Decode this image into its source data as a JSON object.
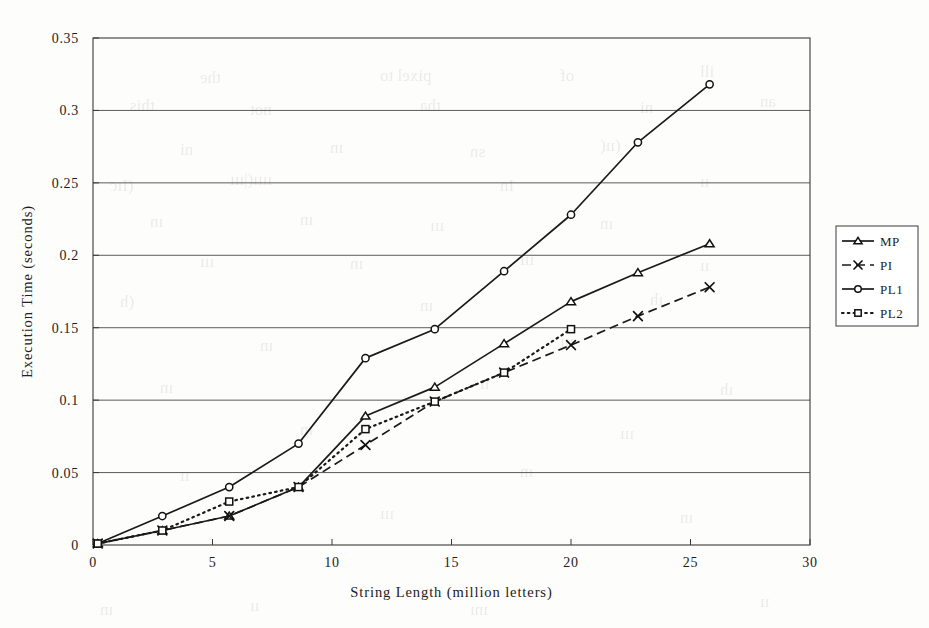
{
  "chart_data": {
    "type": "line",
    "title": "",
    "xlabel": "String Length (million letters)",
    "ylabel": "Execution Time  (seconds)",
    "xlim": [
      0,
      30
    ],
    "ylim": [
      0,
      0.35
    ],
    "xticks": [
      "0",
      "5",
      "10",
      "15",
      "20",
      "25",
      "30"
    ],
    "xtick_values": [
      0,
      5,
      10,
      15,
      20,
      25,
      30
    ],
    "yticks": [
      "0",
      "0.05",
      "0.1",
      "0.15",
      "0.2",
      "0.25",
      "0.3",
      "0.35"
    ],
    "ytick_values": [
      0,
      0.05,
      0.1,
      0.15,
      0.2,
      0.25,
      0.3,
      0.35
    ],
    "grid": "horizontal",
    "legend_position": "right-outside",
    "series": [
      {
        "name": "MP",
        "marker": "triangle",
        "line": "solid",
        "color": "#1a1a1a",
        "x": [
          0.2,
          2.9,
          5.7,
          8.6,
          11.4,
          14.3,
          17.2,
          20.0,
          22.8,
          25.8
        ],
        "y": [
          0.001,
          0.01,
          0.02,
          0.04,
          0.089,
          0.109,
          0.139,
          0.168,
          0.188,
          0.208
        ]
      },
      {
        "name": "PI",
        "marker": "x",
        "line": "dashed",
        "color": "#1a1a1a",
        "x": [
          0.2,
          2.9,
          5.7,
          8.6,
          11.4,
          14.3,
          17.2,
          20.0,
          22.8,
          25.8
        ],
        "y": [
          0.001,
          0.01,
          0.02,
          0.04,
          0.069,
          0.099,
          0.119,
          0.138,
          0.158,
          0.178
        ]
      },
      {
        "name": "PL1",
        "marker": "circle",
        "line": "solid",
        "color": "#1a1a1a",
        "x": [
          0.2,
          2.9,
          5.7,
          8.6,
          11.4,
          14.3,
          17.2,
          20.0,
          22.8,
          25.8
        ],
        "y": [
          0.001,
          0.02,
          0.04,
          0.07,
          0.129,
          0.149,
          0.189,
          0.228,
          0.278,
          0.318
        ]
      },
      {
        "name": "PL2",
        "marker": "square",
        "line": "dotted",
        "color": "#1a1a1a",
        "x": [
          0.2,
          2.9,
          5.7,
          8.6,
          11.4,
          14.3,
          17.2,
          20.0
        ],
        "y": [
          0.001,
          0.01,
          0.03,
          0.04,
          0.08,
          0.099,
          0.119,
          0.149
        ]
      }
    ]
  },
  "legend": {
    "items": [
      {
        "label": "MP"
      },
      {
        "label": "PI"
      },
      {
        "label": "PL1"
      },
      {
        "label": "PL2"
      }
    ]
  },
  "bleed_text": [
    {
      "t": "pixel to",
      "x": 380,
      "y": 66
    },
    {
      "t": "of",
      "x": 560,
      "y": 66
    },
    {
      "t": "the",
      "x": 200,
      "y": 68
    },
    {
      "t": "ill",
      "x": 700,
      "y": 62
    },
    {
      "t": "an",
      "x": 760,
      "y": 92
    },
    {
      "t": "this",
      "x": 130,
      "y": 96
    },
    {
      "t": "not",
      "x": 250,
      "y": 100
    },
    {
      "t": "tha",
      "x": 420,
      "y": 96
    },
    {
      "t": "ni",
      "x": 640,
      "y": 98
    },
    {
      "t": "(ıı(",
      "x": 600,
      "y": 136
    },
    {
      "t": "ni",
      "x": 180,
      "y": 140
    },
    {
      "t": "ın",
      "x": 330,
      "y": 138
    },
    {
      "t": "sn",
      "x": 470,
      "y": 142
    },
    {
      "t": "(Iıc",
      "x": 110,
      "y": 176
    },
    {
      "t": "ıııı(|ııı",
      "x": 230,
      "y": 170
    },
    {
      "t": "In",
      "x": 500,
      "y": 176
    },
    {
      "t": "ıı",
      "x": 700,
      "y": 172
    },
    {
      "t": "ın",
      "x": 150,
      "y": 212
    },
    {
      "t": "ın",
      "x": 300,
      "y": 210
    },
    {
      "t": "ın",
      "x": 600,
      "y": 214
    },
    {
      "t": "ııı",
      "x": 430,
      "y": 216
    },
    {
      "t": "ııı",
      "x": 200,
      "y": 252
    },
    {
      "t": "ın",
      "x": 350,
      "y": 254
    },
    {
      "t": "ııı",
      "x": 520,
      "y": 250
    },
    {
      "t": "ıı",
      "x": 700,
      "y": 256
    },
    {
      "t": "(h",
      "x": 120,
      "y": 292
    },
    {
      "t": "ın",
      "x": 420,
      "y": 296
    },
    {
      "t": "ıh",
      "x": 650,
      "y": 290
    },
    {
      "t": "ın",
      "x": 260,
      "y": 336
    },
    {
      "t": "ııı",
      "x": 560,
      "y": 332
    },
    {
      "t": "ın",
      "x": 160,
      "y": 378
    },
    {
      "t": "ıı",
      "x": 480,
      "y": 374
    },
    {
      "t": "ıh",
      "x": 720,
      "y": 380
    },
    {
      "t": "ın",
      "x": 300,
      "y": 420
    },
    {
      "t": "ııı",
      "x": 620,
      "y": 424
    },
    {
      "t": "ıı",
      "x": 180,
      "y": 466
    },
    {
      "t": "ın",
      "x": 520,
      "y": 462
    },
    {
      "t": "ııı",
      "x": 380,
      "y": 504
    },
    {
      "t": "ın",
      "x": 680,
      "y": 508
    },
    {
      "t": "ıı",
      "x": 250,
      "y": 596
    },
    {
      "t": "ını",
      "x": 470,
      "y": 600
    },
    {
      "t": "ıı",
      "x": 760,
      "y": 592
    },
    {
      "t": "ın",
      "x": 100,
      "y": 600
    }
  ]
}
